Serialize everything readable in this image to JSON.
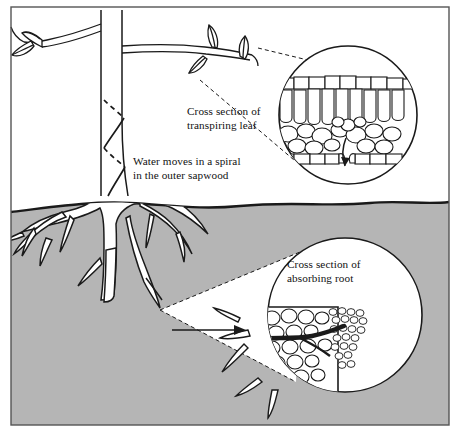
{
  "figure": {
    "title_hidden": "",
    "labels": {
      "leaf_section": "Cross section of\ntranspiring leaf",
      "sapwood": "Water moves in a spiral\nin the outer sapwood",
      "root_section": "Cross section of\nabsorbing root"
    },
    "colors": {
      "soil": "#b5b5b5",
      "soil_edge": "#1a1a1a",
      "ink": "#111111",
      "paper": "#ffffff",
      "frame": "#555555"
    },
    "icon_names": [
      "tree-trunk",
      "branch-left-with-leaves",
      "branch-right-with-leaves",
      "spiral-sapwood-path",
      "root-system",
      "leaf-cross-section-circle",
      "root-cross-section-circle",
      "transpiration-arrow",
      "absorption-arrow",
      "magnifier-leader-lines",
      "magnifier-cone"
    ],
    "parts": {
      "leaf_circle": {
        "cx": 348,
        "cy": 115,
        "r": 70
      },
      "root_circle": {
        "cx": 345,
        "cy": 315,
        "r": 78
      },
      "soil_top_y": 205,
      "frame": {
        "x": 11,
        "y": 7,
        "w": 438,
        "h": 418
      }
    }
  }
}
